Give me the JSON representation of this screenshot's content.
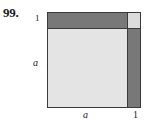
{
  "problem": {
    "number": "99."
  },
  "figure": {
    "caption_labels": {
      "left_top": "1",
      "left_side": "a",
      "bottom_left": "a",
      "bottom_right": "1"
    },
    "regions": [
      {
        "name": "a-squared-square",
        "label": "",
        "shade": "light",
        "color": "#e4e4e4"
      },
      {
        "name": "top-band",
        "label": "",
        "shade": "dark",
        "color": "#787878"
      },
      {
        "name": "right-strip",
        "label": "",
        "shade": "dark",
        "color": "#787878"
      },
      {
        "name": "corner-unit-square",
        "label": "",
        "shade": "light",
        "color": "#dcdcdc"
      }
    ],
    "border_color": "#3a3a3a"
  }
}
